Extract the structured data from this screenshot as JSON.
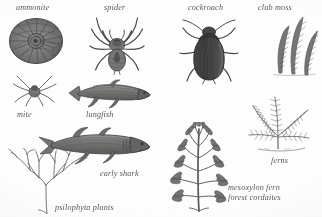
{
  "figure": {
    "background_color": "#fdfdfb",
    "ink_color": "#4a4a48",
    "labels": {
      "ammonite": "ammonite",
      "spider": "spider",
      "cockroach": "cockroach",
      "club_moss": "club moss",
      "mite": "mite",
      "lungfish": "lungfish",
      "early_shark": "early shark",
      "psilophyta_plants": "psilophyta plants",
      "ferns": "ferns",
      "mesoxylon_fern": "mesoxylon fern",
      "forest_cordaites": "forest cordaites"
    },
    "specimens": [
      {
        "name": "ammonite",
        "label": "ammonite",
        "kind": "animal",
        "group": "mollusc"
      },
      {
        "name": "spider",
        "label": "spider",
        "kind": "animal",
        "group": "arachnid"
      },
      {
        "name": "cockroach",
        "label": "cockroach",
        "kind": "animal",
        "group": "insect"
      },
      {
        "name": "club-moss",
        "label": "club moss",
        "kind": "plant",
        "group": "lycophyte"
      },
      {
        "name": "mite",
        "label": "mite",
        "kind": "animal",
        "group": "arachnid"
      },
      {
        "name": "lungfish",
        "label": "lungfish",
        "kind": "animal",
        "group": "fish"
      },
      {
        "name": "early-shark",
        "label": "early shark",
        "kind": "animal",
        "group": "fish"
      },
      {
        "name": "psilophyta-plants",
        "label": "psilophyta plants",
        "kind": "plant",
        "group": "psilophyte"
      },
      {
        "name": "ferns",
        "label": "ferns",
        "kind": "plant",
        "group": "fern"
      },
      {
        "name": "mesoxylon-fern",
        "label": "mesoxylon fern",
        "kind": "plant",
        "group": "gymnosperm"
      },
      {
        "name": "forest-cordaites",
        "label": "forest cordaites",
        "kind": "plant",
        "group": "gymnosperm"
      }
    ]
  }
}
